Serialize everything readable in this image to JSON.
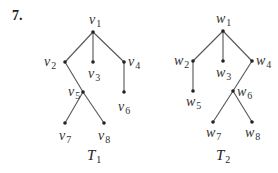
{
  "problem_number": "7.",
  "trees": [
    {
      "name": "T",
      "sub": "1",
      "title_pos": [
        87,
        160
      ],
      "nodes": [
        {
          "id": "v1",
          "base": "v",
          "sub": "1",
          "x": 93,
          "y": 32,
          "lx": 89,
          "ly": 24
        },
        {
          "id": "v2",
          "base": "v",
          "sub": "2",
          "x": 65,
          "y": 62,
          "lx": 44,
          "ly": 66
        },
        {
          "id": "v3",
          "base": "v",
          "sub": "3",
          "x": 93,
          "y": 62,
          "lx": 88,
          "ly": 78
        },
        {
          "id": "v4",
          "base": "v",
          "sub": "4",
          "x": 124,
          "y": 62,
          "lx": 128,
          "ly": 66
        },
        {
          "id": "v5",
          "base": "v",
          "sub": "5",
          "x": 83,
          "y": 92,
          "lx": 68,
          "ly": 96
        },
        {
          "id": "v6",
          "base": "v",
          "sub": "6",
          "x": 124,
          "y": 92,
          "lx": 118,
          "ly": 111
        },
        {
          "id": "v7",
          "base": "v",
          "sub": "7",
          "x": 65,
          "y": 123,
          "lx": 59,
          "ly": 140
        },
        {
          "id": "v8",
          "base": "v",
          "sub": "8",
          "x": 104,
          "y": 123,
          "lx": 98,
          "ly": 140
        }
      ],
      "edges": [
        [
          "v1",
          "v2"
        ],
        [
          "v1",
          "v3"
        ],
        [
          "v1",
          "v4"
        ],
        [
          "v2",
          "v5"
        ],
        [
          "v4",
          "v6"
        ],
        [
          "v5",
          "v7"
        ],
        [
          "v5",
          "v8"
        ]
      ]
    },
    {
      "name": "T",
      "sub": "2",
      "title_pos": [
        216,
        160
      ],
      "nodes": [
        {
          "id": "w1",
          "base": "w",
          "sub": "1",
          "x": 223,
          "y": 31,
          "lx": 216,
          "ly": 23
        },
        {
          "id": "w2",
          "base": "w",
          "sub": "2",
          "x": 193,
          "y": 61,
          "lx": 174,
          "ly": 65
        },
        {
          "id": "w3",
          "base": "w",
          "sub": "3",
          "x": 223,
          "y": 61,
          "lx": 216,
          "ly": 77
        },
        {
          "id": "w4",
          "base": "w",
          "sub": "4",
          "x": 252,
          "y": 61,
          "lx": 256,
          "ly": 65
        },
        {
          "id": "w5",
          "base": "w",
          "sub": "5",
          "x": 193,
          "y": 91,
          "lx": 186,
          "ly": 106
        },
        {
          "id": "w6",
          "base": "w",
          "sub": "6",
          "x": 233,
          "y": 91,
          "lx": 237,
          "ly": 96
        },
        {
          "id": "w7",
          "base": "w",
          "sub": "7",
          "x": 213,
          "y": 122,
          "lx": 206,
          "ly": 137
        },
        {
          "id": "w8",
          "base": "w",
          "sub": "8",
          "x": 252,
          "y": 122,
          "lx": 245,
          "ly": 137
        }
      ],
      "edges": [
        [
          "w1",
          "w2"
        ],
        [
          "w1",
          "w3"
        ],
        [
          "w1",
          "w4"
        ],
        [
          "w2",
          "w5"
        ],
        [
          "w4",
          "w6"
        ],
        [
          "w6",
          "w7"
        ],
        [
          "w6",
          "w8"
        ]
      ]
    }
  ],
  "colors": {
    "edge": "#555555",
    "node": "#222222",
    "text": "#333333"
  }
}
